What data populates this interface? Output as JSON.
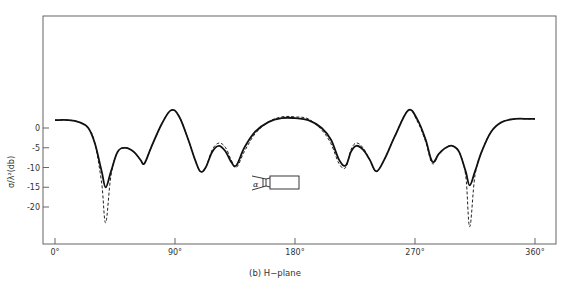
{
  "chart_data": {
    "type": "line",
    "title": "",
    "caption": "(b) H−plane",
    "xlabel": "",
    "ylabel": "σ/λ²(db)",
    "xlim": [
      0,
      360
    ],
    "ylim": [
      -30,
      28
    ],
    "grid": false,
    "legend": null,
    "x_ticks": [
      {
        "value": 0,
        "label": "0°"
      },
      {
        "value": 90,
        "label": "90°"
      },
      {
        "value": 180,
        "label": "180°"
      },
      {
        "value": 270,
        "label": "270°"
      },
      {
        "value": 360,
        "label": "360°"
      }
    ],
    "y_ticks": [
      {
        "value": 0,
        "label": "0"
      },
      {
        "value": -5,
        "label": "-5"
      },
      {
        "value": -10,
        "label": "-10"
      },
      {
        "value": -15,
        "label": "-15"
      },
      {
        "value": -20,
        "label": "-20"
      }
    ],
    "series": [
      {
        "name": "solid",
        "style": "solid",
        "x": [
          0,
          10,
          18,
          25,
          30,
          35,
          38,
          42,
          47,
          53,
          59,
          64,
          67,
          72,
          80,
          87,
          93,
          100,
          105,
          109,
          113,
          118,
          123,
          128,
          132,
          136,
          142,
          150,
          160,
          170,
          180,
          190,
          200,
          207,
          213,
          218,
          222,
          226,
          231,
          236,
          241,
          247,
          255,
          265,
          272,
          278,
          283,
          288,
          293,
          298,
          303,
          308,
          311,
          315,
          320,
          327,
          335,
          345,
          355,
          360
        ],
        "y": [
          2,
          2,
          1.5,
          0,
          -4,
          -11,
          -15,
          -11,
          -6,
          -5,
          -6,
          -8,
          -9,
          -5,
          1,
          4.5,
          3,
          -3,
          -8,
          -11,
          -10,
          -6,
          -4.5,
          -6,
          -8.5,
          -9.5,
          -5,
          -1,
          1.5,
          2.5,
          2.5,
          2,
          0,
          -3,
          -8,
          -9.5,
          -6,
          -4.5,
          -5.5,
          -8,
          -11,
          -8,
          -2,
          4.5,
          2,
          -3,
          -8.5,
          -6.5,
          -5,
          -4.5,
          -6,
          -11,
          -14.5,
          -11,
          -6,
          -1,
          1.5,
          2.3,
          2.3,
          2.3
        ]
      },
      {
        "name": "dashed",
        "style": "dashed",
        "x": [
          0,
          10,
          18,
          25,
          30,
          35,
          38,
          42,
          47,
          53,
          59,
          64,
          67,
          72,
          80,
          87,
          93,
          100,
          105,
          109,
          113,
          118,
          123,
          128,
          132,
          136,
          142,
          150,
          160,
          170,
          180,
          190,
          200,
          207,
          213,
          218,
          222,
          226,
          231,
          236,
          241,
          247,
          255,
          265,
          272,
          278,
          283,
          288,
          293,
          298,
          303,
          308,
          311,
          315,
          320,
          327,
          335,
          345,
          355,
          360
        ],
        "y": [
          2,
          2,
          1.5,
          0,
          -4,
          -14,
          -24,
          -12,
          -6,
          -5,
          -6,
          -8,
          -9,
          -5,
          1,
          4.5,
          3,
          -3,
          -8,
          -11,
          -10,
          -5.5,
          -3.8,
          -5,
          -8,
          -10,
          -6,
          -1.5,
          1.5,
          2.8,
          2.8,
          2.3,
          -0.5,
          -4,
          -9,
          -10,
          -5.5,
          -3.8,
          -5,
          -8,
          -11,
          -8,
          -2,
          4.5,
          1.5,
          -3.5,
          -9,
          -6.5,
          -5,
          -4.5,
          -6,
          -12,
          -25,
          -12,
          -6,
          -1,
          1.5,
          2.3,
          2.3,
          2.3
        ]
      }
    ],
    "inset": {
      "symbol": "α",
      "description": "target body with aspect angle"
    }
  }
}
